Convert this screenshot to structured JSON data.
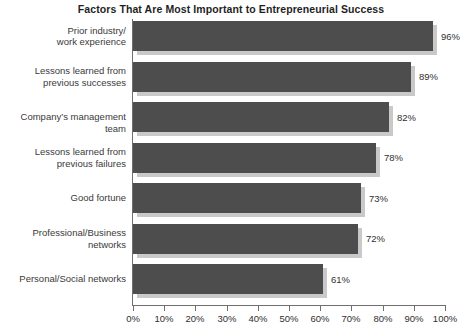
{
  "chart_data": {
    "type": "bar",
    "orientation": "horizontal",
    "title": "Factors That Are Most Important to Entrepreneurial Success",
    "xlabel": "",
    "ylabel": "",
    "xlim": [
      0,
      100
    ],
    "grid": false,
    "legend": null,
    "categories": [
      "Prior industry/\nwork experience",
      "Lessons learned from\nprevious successes",
      "Company’s management team",
      "Lessons learned from\nprevious failures",
      "Good fortune",
      "Professional/Business\nnetworks",
      "Personal/Social networks"
    ],
    "values": [
      96,
      89,
      82,
      78,
      73,
      72,
      61
    ],
    "value_labels": [
      "96%",
      "89%",
      "82%",
      "78%",
      "73%",
      "72%",
      "61%"
    ],
    "xticks": [
      0,
      10,
      20,
      30,
      40,
      50,
      60,
      70,
      80,
      90,
      100
    ],
    "xticklabels": [
      "0%",
      "10%",
      "20%",
      "30%",
      "40%",
      "50%",
      "60%",
      "70%",
      "80%",
      "90%",
      "100%"
    ],
    "colors": {
      "bar": "#4d4d4d",
      "bar_shadow": "#c9c9c9",
      "axis": "#6f6f6f",
      "text": "#2f2f2f",
      "title": "#1f1f1f",
      "background": "#ffffff"
    }
  },
  "rows": [
    {
      "label_line1": "Prior industry/",
      "label_line2": "work experience",
      "value": 96,
      "value_label": "96%"
    },
    {
      "label_line1": "Lessons learned from",
      "label_line2": "previous successes",
      "value": 89,
      "value_label": "89%"
    },
    {
      "label_line1": "Company’s management team",
      "label_line2": "",
      "value": 82,
      "value_label": "82%"
    },
    {
      "label_line1": "Lessons learned from",
      "label_line2": "previous failures",
      "value": 78,
      "value_label": "78%"
    },
    {
      "label_line1": "Good fortune",
      "label_line2": "",
      "value": 73,
      "value_label": "73%"
    },
    {
      "label_line1": "Professional/Business",
      "label_line2": "networks",
      "value": 72,
      "value_label": "72%"
    },
    {
      "label_line1": "Personal/Social networks",
      "label_line2": "",
      "value": 61,
      "value_label": "61%"
    }
  ],
  "xaxis": {
    "ticks": [
      "0%",
      "10%",
      "20%",
      "30%",
      "40%",
      "50%",
      "60%",
      "70%",
      "80%",
      "90%",
      "100%"
    ]
  }
}
